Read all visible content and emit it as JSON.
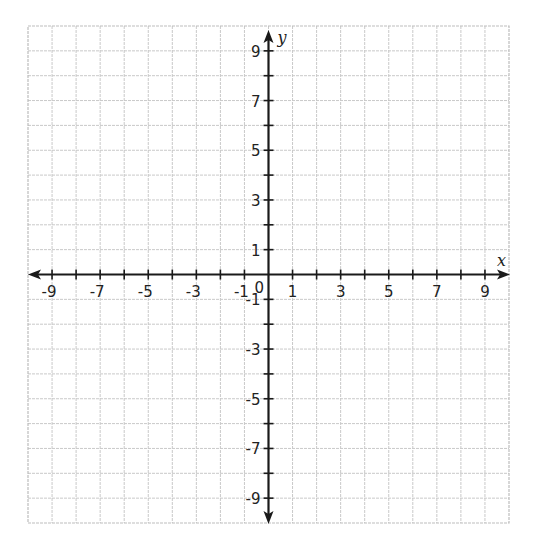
{
  "diagram": {
    "type": "coordinate-plane",
    "x_range": [
      -10,
      10
    ],
    "y_range": [
      -10,
      10
    ],
    "grid_step": 1,
    "axes": {
      "x_label": "x",
      "y_label": "y",
      "origin_label": "0"
    },
    "x_tick_labels": [
      {
        "value": -9,
        "text": "-9"
      },
      {
        "value": -7,
        "text": "-7"
      },
      {
        "value": -5,
        "text": "-5"
      },
      {
        "value": -3,
        "text": "-3"
      },
      {
        "value": -1,
        "text": "-1"
      },
      {
        "value": 1,
        "text": "1"
      },
      {
        "value": 3,
        "text": "3"
      },
      {
        "value": 5,
        "text": "5"
      },
      {
        "value": 7,
        "text": "7"
      },
      {
        "value": 9,
        "text": "9"
      }
    ],
    "y_tick_labels": [
      {
        "value": 9,
        "text": "9"
      },
      {
        "value": 7,
        "text": "7"
      },
      {
        "value": 5,
        "text": "5"
      },
      {
        "value": 3,
        "text": "3"
      },
      {
        "value": 1,
        "text": "1"
      },
      {
        "value": -1,
        "text": "-1"
      },
      {
        "value": -3,
        "text": "-3"
      },
      {
        "value": -5,
        "text": "-5"
      },
      {
        "value": -7,
        "text": "-7"
      },
      {
        "value": -9,
        "text": "-9"
      }
    ],
    "colors": {
      "grid": "#c9c9c9",
      "axis": "#1a1a1a",
      "text": "#222222"
    }
  }
}
